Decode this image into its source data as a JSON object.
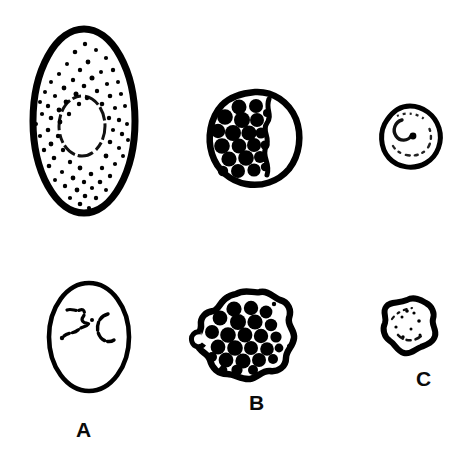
{
  "figure": {
    "background_color": "#ffffff",
    "ink_color": "#000000",
    "width": 474,
    "height": 469
  },
  "labels": [
    {
      "id": "label-a",
      "text": "A",
      "x": 76,
      "y": 419
    },
    {
      "id": "label-b",
      "text": "B",
      "x": 249,
      "y": 392
    },
    {
      "id": "label-c",
      "text": "C",
      "x": 416,
      "y": 368
    }
  ],
  "specimens": [
    {
      "id": "specimen-a-top",
      "label": "A",
      "row": "top",
      "column": 1,
      "shape": "oval",
      "description": "Large oval cell with dense fine stippling and central clear oval vacuole",
      "outline_thickness": "thick",
      "contents": "fine stipple dots",
      "granule_count": 0,
      "bbox": {
        "x": 31,
        "y": 28,
        "width": 105,
        "height": 188
      }
    },
    {
      "id": "specimen-b-top",
      "label": "B",
      "row": "top",
      "column": 2,
      "shape": "round",
      "description": "Round cell densely packed with large dark granules and a clear crescent at right",
      "outline_thickness": "thick",
      "contents": "large dark granules",
      "granule_count": 21,
      "bbox": {
        "x": 212,
        "y": 96,
        "width": 85,
        "height": 86
      }
    },
    {
      "id": "specimen-c-top",
      "label": "C",
      "row": "top",
      "column": 3,
      "shape": "round",
      "description": "Small round clear cell with faint curved internal hook marking",
      "outline_thickness": "medium",
      "contents": "clear with faint internal mark",
      "granule_count": 0,
      "bbox": {
        "x": 383,
        "y": 110,
        "width": 54,
        "height": 53
      }
    },
    {
      "id": "specimen-a-bottom",
      "label": "A",
      "row": "bottom",
      "column": 1,
      "shape": "oval",
      "description": "Large clear oval cell with thin outline and small irregular internal chromatin mark",
      "outline_thickness": "thin",
      "contents": "clear with zigzag and C-shaped marks",
      "granule_count": 0,
      "bbox": {
        "x": 48,
        "y": 283,
        "width": 80,
        "height": 107
      }
    },
    {
      "id": "specimen-b-bottom",
      "label": "B",
      "row": "bottom",
      "column": 2,
      "shape": "irregular-lobed",
      "description": "Irregular amoeboid cell with lobed pseudopodia densely filled with dark granules",
      "outline_thickness": "thick",
      "contents": "large dark granules",
      "granule_count": 25,
      "bbox": {
        "x": 196,
        "y": 293,
        "width": 105,
        "height": 95
      }
    },
    {
      "id": "specimen-c-bottom",
      "label": "C",
      "row": "bottom",
      "column": 3,
      "shape": "irregular-lobed",
      "description": "Small irregular amoeboid cell, mostly clear with faint internal speckles",
      "outline_thickness": "thick",
      "contents": "clear with faint speckles",
      "granule_count": 0,
      "bbox": {
        "x": 385,
        "y": 300,
        "width": 50,
        "height": 55
      }
    }
  ]
}
